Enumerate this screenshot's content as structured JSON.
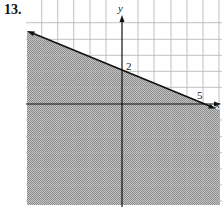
{
  "problem": {
    "number": "13."
  },
  "graph": {
    "axes": {
      "x_label": "x",
      "y_label": "y"
    },
    "intercept_labels": {
      "y_intercept": "2",
      "x_intercept": "5"
    },
    "boundary_line": {
      "equation": "y = -2/5 x + 2",
      "style": "solid",
      "points": [
        [
          0,
          2
        ],
        [
          5,
          0
        ]
      ]
    },
    "shaded_region": "below line",
    "inequality": "y <= -2/5 x + 2",
    "grid": {
      "x_range": [
        -6,
        6
      ],
      "y_range": [
        -6,
        5
      ],
      "unit": 1
    },
    "colors": {
      "grid": "#b0b0b0",
      "line": "#111111",
      "shade": "#a8a8a8"
    }
  }
}
